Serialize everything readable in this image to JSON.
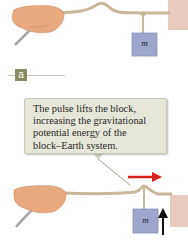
{
  "panel_a": {
    "label": "a",
    "mass_label": "m"
  },
  "callout": {
    "lines": [
      "The pulse lifts the block,",
      "increasing the gravitational",
      "potential energy of the",
      "block–Earth system."
    ]
  },
  "panel_b": {
    "mass_label": "m",
    "arrow_right": "pulse-direction",
    "arrow_up": "block-lift-direction"
  },
  "colors": {
    "rope": "#c9b79c",
    "hand": "#e9a97e",
    "block": "#9fa6cc",
    "wall": "#e8c8bc",
    "red_arrow": "#d8231c",
    "callout_bg": "#e6e6d9",
    "label_bg": "#8a8a64"
  }
}
